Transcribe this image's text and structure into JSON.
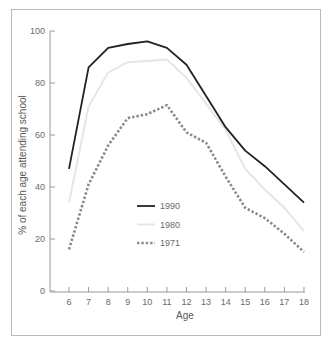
{
  "chart_data": {
    "type": "line",
    "title": "",
    "xlabel": "Age",
    "ylabel": "% of each age attending school",
    "x": [
      6,
      7,
      8,
      9,
      10,
      11,
      12,
      13,
      14,
      15,
      16,
      17,
      18
    ],
    "xticks": [
      "6",
      "7",
      "8",
      "9",
      "10",
      "11",
      "12",
      "13",
      "14",
      "15",
      "16",
      "17",
      "18"
    ],
    "yticks": [
      "0",
      "20",
      "40",
      "60",
      "80",
      "100"
    ],
    "ylim": [
      0,
      100
    ],
    "grid": false,
    "legend_position": "center-left inside plot",
    "series": [
      {
        "name": "1990",
        "style": "solid",
        "color": "#222222",
        "values": [
          47,
          86,
          93.5,
          95,
          96,
          93.5,
          87,
          75,
          63,
          54,
          48,
          41,
          34
        ]
      },
      {
        "name": "1980",
        "style": "solid-light",
        "color": "#e6e6e6",
        "values": [
          34,
          71,
          84,
          88,
          88.5,
          89,
          82,
          72,
          62,
          47,
          39,
          32,
          23
        ]
      },
      {
        "name": "1971",
        "style": "dotted",
        "color": "#8a8a8a",
        "values": [
          16,
          41,
          56,
          66.5,
          68,
          71.5,
          61,
          57,
          44,
          32,
          28,
          22,
          15
        ]
      }
    ]
  }
}
